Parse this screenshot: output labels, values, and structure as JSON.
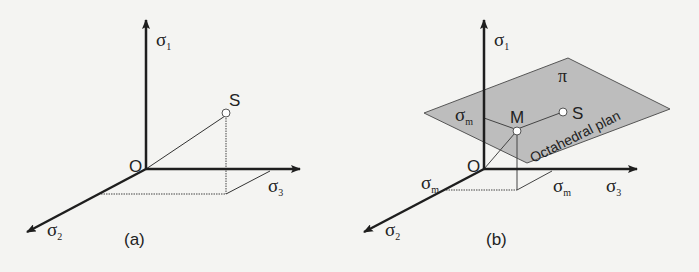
{
  "colors": {
    "background": "#f4f4f2",
    "axis": "#1e1e1e",
    "plane_fill": "#bdbdbd",
    "plane_stroke": "#555555",
    "point_fill": "#ffffff"
  },
  "panel_a": {
    "caption": "(a)",
    "origin_label": "O",
    "point_label": "S",
    "axes": {
      "sigma1": {
        "symbol": "σ",
        "subscript": "1"
      },
      "sigma2": {
        "symbol": "σ",
        "subscript": "2"
      },
      "sigma3": {
        "symbol": "σ",
        "subscript": "3"
      }
    }
  },
  "panel_b": {
    "caption": "(b)",
    "origin_label": "O",
    "point_s_label": "S",
    "point_m_label": "M",
    "plane_label": "π",
    "plane_name": "Octahedral plan",
    "axes": {
      "sigma1": {
        "symbol": "σ",
        "subscript": "1"
      },
      "sigma2": {
        "symbol": "σ",
        "subscript": "2"
      },
      "sigma3": {
        "symbol": "σ",
        "subscript": "3"
      }
    },
    "mean_stress": {
      "symbol": "σ",
      "subscript": "m"
    }
  }
}
